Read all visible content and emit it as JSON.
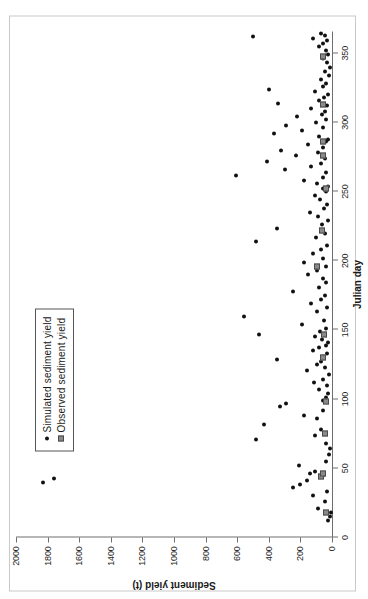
{
  "chart_data": {
    "type": "scatter",
    "title": "",
    "xlabel": "Julian day",
    "ylabel": "Sediment yield (t)",
    "xlim": [
      0,
      365
    ],
    "ylim": [
      0,
      2000
    ],
    "xticks": [
      0,
      50,
      100,
      150,
      200,
      250,
      300,
      350
    ],
    "yticks": [
      0,
      200,
      400,
      600,
      800,
      1000,
      1200,
      1400,
      1600,
      1800,
      2000
    ],
    "xtick_labels": [
      "0",
      "50",
      "100",
      "150",
      "200",
      "250",
      "300",
      "350"
    ],
    "ytick_labels": [
      "0",
      "200",
      "400",
      "600",
      "800",
      "1000",
      "1200",
      "1400",
      "1600",
      "1800",
      "2000"
    ],
    "grid": false,
    "legend_position": "upper-left",
    "series": [
      {
        "name": "Simulated sediment yield",
        "marker": "circle",
        "color": "#111111",
        "points": [
          [
            12,
            25
          ],
          [
            15,
            10
          ],
          [
            18,
            8
          ],
          [
            21,
            90
          ],
          [
            26,
            45
          ],
          [
            30,
            120
          ],
          [
            33,
            30
          ],
          [
            36,
            250
          ],
          [
            38,
            200
          ],
          [
            40,
            1830
          ],
          [
            41,
            160
          ],
          [
            43,
            1760
          ],
          [
            45,
            60
          ],
          [
            46,
            140
          ],
          [
            48,
            110
          ],
          [
            52,
            210
          ],
          [
            55,
            40
          ],
          [
            60,
            20
          ],
          [
            64,
            15
          ],
          [
            68,
            35
          ],
          [
            71,
            480
          ],
          [
            74,
            110
          ],
          [
            78,
            70
          ],
          [
            82,
            430
          ],
          [
            86,
            95
          ],
          [
            88,
            175
          ],
          [
            92,
            60
          ],
          [
            95,
            330
          ],
          [
            97,
            290
          ],
          [
            99,
            55
          ],
          [
            101,
            40
          ],
          [
            104,
            25
          ],
          [
            107,
            80
          ],
          [
            110,
            30
          ],
          [
            112,
            115
          ],
          [
            114,
            60
          ],
          [
            118,
            20
          ],
          [
            121,
            160
          ],
          [
            123,
            45
          ],
          [
            125,
            95
          ],
          [
            127,
            70
          ],
          [
            129,
            350
          ],
          [
            131,
            55
          ],
          [
            133,
            30
          ],
          [
            135,
            120
          ],
          [
            137,
            85
          ],
          [
            139,
            40
          ],
          [
            141,
            25
          ],
          [
            143,
            65
          ],
          [
            145,
            105
          ],
          [
            147,
            460
          ],
          [
            149,
            75
          ],
          [
            151,
            35
          ],
          [
            154,
            190
          ],
          [
            157,
            50
          ],
          [
            160,
            560
          ],
          [
            163,
            95
          ],
          [
            166,
            30
          ],
          [
            169,
            130
          ],
          [
            172,
            70
          ],
          [
            175,
            45
          ],
          [
            178,
            250
          ],
          [
            181,
            85
          ],
          [
            184,
            40
          ],
          [
            187,
            60
          ],
          [
            190,
            150
          ],
          [
            193,
            95
          ],
          [
            196,
            35
          ],
          [
            199,
            180
          ],
          [
            202,
            55
          ],
          [
            205,
            120
          ],
          [
            208,
            70
          ],
          [
            211,
            30
          ],
          [
            214,
            480
          ],
          [
            217,
            100
          ],
          [
            220,
            45
          ],
          [
            223,
            350
          ],
          [
            226,
            65
          ],
          [
            229,
            25
          ],
          [
            232,
            90
          ],
          [
            235,
            140
          ],
          [
            238,
            50
          ],
          [
            241,
            30
          ],
          [
            244,
            75
          ],
          [
            247,
            110
          ],
          [
            250,
            40
          ],
          [
            252,
            60
          ],
          [
            254,
            25
          ],
          [
            256,
            95
          ],
          [
            258,
            180
          ],
          [
            260,
            55
          ],
          [
            262,
            610
          ],
          [
            264,
            35
          ],
          [
            266,
            300
          ],
          [
            268,
            130
          ],
          [
            270,
            70
          ],
          [
            272,
            410
          ],
          [
            274,
            45
          ],
          [
            276,
            230
          ],
          [
            278,
            90
          ],
          [
            280,
            320
          ],
          [
            282,
            60
          ],
          [
            284,
            150
          ],
          [
            286,
            40
          ],
          [
            288,
            25
          ],
          [
            290,
            80
          ],
          [
            292,
            370
          ],
          [
            294,
            190
          ],
          [
            296,
            55
          ],
          [
            298,
            290
          ],
          [
            300,
            100
          ],
          [
            302,
            35
          ],
          [
            304,
            220
          ],
          [
            306,
            65
          ],
          [
            308,
            45
          ],
          [
            310,
            130
          ],
          [
            312,
            30
          ],
          [
            314,
            340
          ],
          [
            316,
            85
          ],
          [
            318,
            50
          ],
          [
            320,
            25
          ],
          [
            322,
            110
          ],
          [
            324,
            400
          ],
          [
            326,
            60
          ],
          [
            328,
            35
          ],
          [
            331,
            70
          ],
          [
            334,
            20
          ],
          [
            337,
            45
          ],
          [
            340,
            15
          ],
          [
            343,
            30
          ],
          [
            346,
            55
          ],
          [
            349,
            25
          ],
          [
            352,
            40
          ],
          [
            355,
            85
          ],
          [
            357,
            60
          ],
          [
            359,
            30
          ],
          [
            361,
            120
          ],
          [
            362,
            500
          ],
          [
            363,
            45
          ],
          [
            364,
            70
          ]
        ]
      },
      {
        "name": "Observed sediment yield",
        "marker": "square",
        "color": "#8a8a8a",
        "points": [
          [
            18,
            35
          ],
          [
            44,
            70
          ],
          [
            46,
            55
          ],
          [
            75,
            45
          ],
          [
            98,
            40
          ],
          [
            130,
            60
          ],
          [
            147,
            50
          ],
          [
            196,
            95
          ],
          [
            222,
            65
          ],
          [
            252,
            40
          ],
          [
            276,
            55
          ],
          [
            286,
            60
          ],
          [
            313,
            60
          ],
          [
            348,
            55
          ]
        ]
      }
    ]
  },
  "legend": {
    "items": [
      {
        "label": "Simulated sediment yield",
        "marker": "dot-marker"
      },
      {
        "label": "Observed sediment yield",
        "marker": "square-marker"
      }
    ]
  },
  "colors": {
    "simulated": "#111111",
    "observed": "#8a8a8a",
    "axis": "#6e6e6e",
    "frame": "#c9c9c9",
    "text": "#1a1a1a"
  }
}
